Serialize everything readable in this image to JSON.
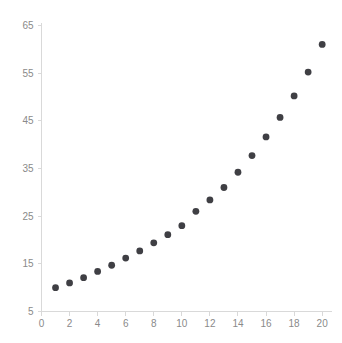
{
  "chart_data": {
    "type": "scatter",
    "title": "",
    "subtitle": "",
    "xlabel": "",
    "ylabel": "",
    "grid": false,
    "legend": null,
    "marker": {
      "shape": "circle",
      "color": "#3f3f44",
      "radius_px": 3.4
    },
    "axis_color": "#d9d9d9",
    "tick_label_color": "#8a8a8a",
    "background_color": "#ffffff",
    "xlim": [
      0,
      20.7
    ],
    "ylim": [
      5,
      65.6
    ],
    "xticks": [
      0,
      2,
      4,
      6,
      8,
      10,
      12,
      14,
      16,
      18,
      20
    ],
    "xtick_labels": [
      "0",
      "2",
      "4",
      "6",
      "8",
      "10",
      "12",
      "14",
      "16",
      "18",
      "20"
    ],
    "yticks": [
      5,
      15,
      25,
      35,
      45,
      55,
      65
    ],
    "ytick_labels": [
      "5",
      "15",
      "25",
      "35",
      "45",
      "55",
      "65"
    ],
    "x": [
      1,
      2,
      3,
      4,
      5,
      6,
      7,
      8,
      9,
      10,
      11,
      12,
      13,
      14,
      15,
      16,
      17,
      18,
      19,
      20
    ],
    "y": [
      10.0,
      11.0,
      12.1,
      13.4,
      14.7,
      16.2,
      17.7,
      19.4,
      21.1,
      23.0,
      26.0,
      28.4,
      31.0,
      34.2,
      37.7,
      41.6,
      45.7,
      50.2,
      55.2,
      61.0
    ],
    "points": [
      {
        "x": 1,
        "y": 10.0
      },
      {
        "x": 2,
        "y": 11.0
      },
      {
        "x": 3,
        "y": 12.1
      },
      {
        "x": 4,
        "y": 13.4
      },
      {
        "x": 5,
        "y": 14.7
      },
      {
        "x": 6,
        "y": 16.2
      },
      {
        "x": 7,
        "y": 17.7
      },
      {
        "x": 8,
        "y": 19.4
      },
      {
        "x": 9,
        "y": 21.1
      },
      {
        "x": 10,
        "y": 23.0
      },
      {
        "x": 11,
        "y": 26.0
      },
      {
        "x": 12,
        "y": 28.4
      },
      {
        "x": 13,
        "y": 31.0
      },
      {
        "x": 14,
        "y": 34.2
      },
      {
        "x": 15,
        "y": 37.7
      },
      {
        "x": 16,
        "y": 41.6
      },
      {
        "x": 17,
        "y": 45.7
      },
      {
        "x": 18,
        "y": 50.2
      },
      {
        "x": 19,
        "y": 55.2
      },
      {
        "x": 20,
        "y": 61.0
      }
    ]
  }
}
